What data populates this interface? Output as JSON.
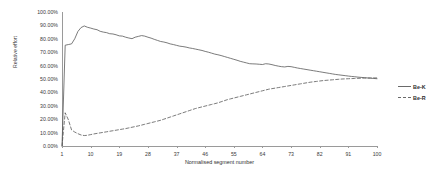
{
  "chart_data": {
    "type": "line",
    "title": "",
    "xlabel": "Normalised segment number",
    "ylabel": "Relative effort",
    "xlim": [
      1,
      100
    ],
    "ylim": [
      0,
      1
    ],
    "grid": false,
    "legend_position": "right",
    "y_tick_labels": [
      "100.00%",
      "90.00%",
      "80.00%",
      "70.00%",
      "60.00%",
      "50.00%",
      "40.00%",
      "30.00%",
      "20.00%",
      "10.00%",
      "0.00%"
    ],
    "y_tick_values": [
      1.0,
      0.9,
      0.8,
      0.7,
      0.6,
      0.5,
      0.4,
      0.3,
      0.2,
      0.1,
      0.0
    ],
    "x_tick_labels": [
      "1",
      "10",
      "19",
      "28",
      "37",
      "46",
      "55",
      "64",
      "73",
      "82",
      "91",
      "100"
    ],
    "x_tick_values": [
      1,
      10,
      19,
      28,
      37,
      46,
      55,
      64,
      73,
      82,
      91,
      100
    ],
    "x": [
      1,
      2,
      3,
      4,
      5,
      6,
      7,
      8,
      9,
      10,
      11,
      12,
      13,
      14,
      15,
      16,
      17,
      18,
      19,
      20,
      21,
      22,
      23,
      24,
      25,
      26,
      27,
      28,
      29,
      30,
      31,
      32,
      33,
      34,
      35,
      36,
      37,
      38,
      39,
      40,
      41,
      42,
      43,
      44,
      45,
      46,
      47,
      48,
      49,
      50,
      51,
      52,
      53,
      54,
      55,
      56,
      57,
      58,
      59,
      60,
      61,
      62,
      63,
      64,
      65,
      66,
      67,
      68,
      69,
      70,
      71,
      72,
      73,
      74,
      75,
      76,
      77,
      78,
      79,
      80,
      81,
      82,
      83,
      84,
      85,
      86,
      87,
      88,
      89,
      90,
      91,
      92,
      93,
      94,
      95,
      96,
      97,
      98,
      99,
      100
    ],
    "series": [
      {
        "name": "Be-K",
        "style": "solid",
        "color": "#595959",
        "values": [
          0.0,
          0.752,
          0.757,
          0.762,
          0.8,
          0.855,
          0.884,
          0.896,
          0.886,
          0.88,
          0.873,
          0.868,
          0.856,
          0.85,
          0.846,
          0.838,
          0.836,
          0.83,
          0.822,
          0.82,
          0.812,
          0.806,
          0.801,
          0.812,
          0.818,
          0.824,
          0.82,
          0.812,
          0.805,
          0.796,
          0.788,
          0.78,
          0.776,
          0.77,
          0.762,
          0.757,
          0.751,
          0.745,
          0.742,
          0.738,
          0.732,
          0.728,
          0.723,
          0.718,
          0.713,
          0.706,
          0.7,
          0.693,
          0.686,
          0.681,
          0.675,
          0.668,
          0.661,
          0.654,
          0.647,
          0.64,
          0.632,
          0.626,
          0.62,
          0.614,
          0.613,
          0.612,
          0.61,
          0.608,
          0.614,
          0.612,
          0.607,
          0.601,
          0.596,
          0.592,
          0.59,
          0.594,
          0.592,
          0.587,
          0.582,
          0.578,
          0.574,
          0.57,
          0.566,
          0.562,
          0.558,
          0.554,
          0.55,
          0.546,
          0.542,
          0.538,
          0.534,
          0.531,
          0.528,
          0.525,
          0.522,
          0.519,
          0.517,
          0.514,
          0.512,
          0.51,
          0.508,
          0.506,
          0.504,
          0.502
        ]
      },
      {
        "name": "Be-R",
        "style": "dashed",
        "color": "#595959",
        "values": [
          0.0,
          0.248,
          0.196,
          0.12,
          0.104,
          0.092,
          0.082,
          0.078,
          0.08,
          0.085,
          0.09,
          0.094,
          0.098,
          0.102,
          0.106,
          0.11,
          0.114,
          0.118,
          0.122,
          0.126,
          0.13,
          0.135,
          0.14,
          0.145,
          0.15,
          0.156,
          0.162,
          0.168,
          0.174,
          0.18,
          0.186,
          0.192,
          0.2,
          0.208,
          0.216,
          0.224,
          0.232,
          0.24,
          0.248,
          0.256,
          0.264,
          0.272,
          0.28,
          0.286,
          0.292,
          0.298,
          0.304,
          0.31,
          0.316,
          0.322,
          0.33,
          0.338,
          0.346,
          0.352,
          0.358,
          0.364,
          0.37,
          0.376,
          0.382,
          0.388,
          0.394,
          0.4,
          0.406,
          0.412,
          0.418,
          0.424,
          0.428,
          0.432,
          0.436,
          0.44,
          0.444,
          0.448,
          0.452,
          0.456,
          0.46,
          0.464,
          0.468,
          0.472,
          0.476,
          0.479,
          0.482,
          0.485,
          0.488,
          0.49,
          0.492,
          0.494,
          0.496,
          0.498,
          0.5,
          0.501,
          0.502,
          0.503,
          0.504,
          0.505,
          0.506,
          0.507,
          0.507,
          0.508,
          0.508,
          0.508
        ]
      }
    ]
  },
  "legend": {
    "items": [
      {
        "label": "Be-K",
        "style": "solid"
      },
      {
        "label": "Be-R",
        "style": "dashed"
      }
    ]
  }
}
